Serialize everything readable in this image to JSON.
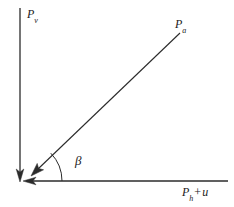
{
  "figure": {
    "background_color": "#ffffff",
    "stroke_color": "#2b2b2b",
    "text_color": "#1a1a1a",
    "width": 234,
    "height": 207,
    "origin": {
      "x": 22,
      "y": 181
    }
  },
  "labels": {
    "vertical_axis": {
      "base": "P",
      "subscript": "v",
      "full": "Pv"
    },
    "diagonal_vector": {
      "base": "P",
      "subscript": "a",
      "full": "Pa"
    },
    "horizontal_axis": {
      "base": "P",
      "subscript": "h",
      "operator": "+",
      "term": "u",
      "full": "Ph + u"
    },
    "angle": {
      "symbol": "β",
      "name": "beta"
    }
  },
  "geometry": {
    "vertical_axis": {
      "x": 20,
      "y_top": 8,
      "y_bottom": 181,
      "arrow_direction": "down"
    },
    "horizontal_axis": {
      "y": 181,
      "x_left": 22,
      "x_right": 228,
      "arrow_direction": "left"
    },
    "diagonal_vector": {
      "x_start": 180,
      "y_start": 33,
      "x_end": 31,
      "y_end": 176,
      "arrow_direction": "down-left"
    },
    "angle_arc": {
      "center_x": 22,
      "center_y": 181,
      "radius": 40,
      "start_angle_deg": 0,
      "end_angle_deg": 44
    }
  }
}
